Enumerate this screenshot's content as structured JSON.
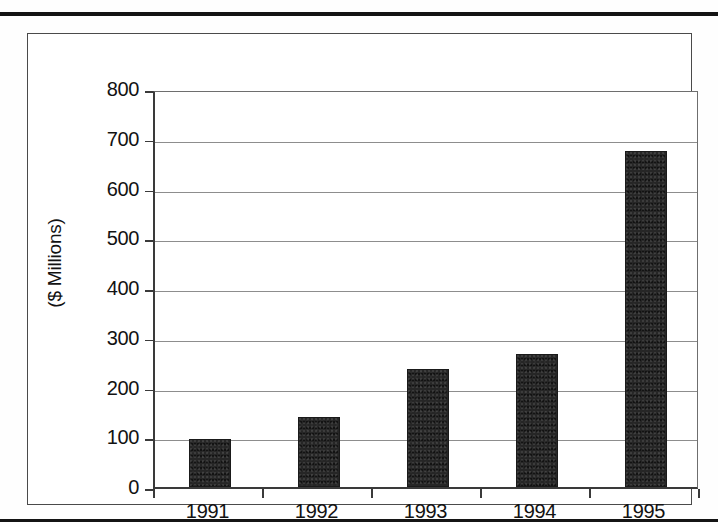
{
  "chart_data": {
    "type": "bar",
    "title": "",
    "subtitle": "",
    "xlabel": "",
    "ylabel": "($ Millions)",
    "categories": [
      "1991",
      "1992",
      "1993",
      "1994",
      "1995"
    ],
    "values": [
      97,
      140,
      238,
      268,
      676
    ],
    "series": [
      {
        "name": "",
        "values": [
          97,
          140,
          238,
          268,
          676
        ]
      }
    ],
    "ylim": [
      0,
      800
    ],
    "y_ticks": [
      0,
      100,
      200,
      300,
      400,
      500,
      600,
      700,
      800
    ],
    "y_tick_labels": [
      "0",
      "100",
      "200",
      "300",
      "400",
      "500",
      "600",
      "700",
      "800"
    ],
    "grid": true,
    "grid_axis": "y",
    "legend": false,
    "legend_position": "none",
    "bar_color": "#262626",
    "axis_color": "#3a3a3a",
    "gridline_color": "#8d8d8d",
    "background_color": "#ffffff",
    "annotations": []
  },
  "figure": {
    "frame_border_color": "#4a4a4a",
    "page_rule_color": "#141414"
  }
}
